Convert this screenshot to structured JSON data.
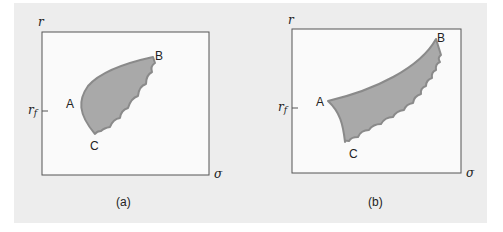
{
  "figure": {
    "colors": {
      "background": "#ededed",
      "plot_area": "#fafafa",
      "region_fill": "#a9a9a9",
      "region_edge": "#8a8a8a",
      "axis": "#555555"
    },
    "panels": [
      {
        "caption": "(a)",
        "y_axis_label": "r",
        "x_axis_label": "σ",
        "tick_label": "r",
        "tick_sub": "f",
        "points": {
          "A": "A",
          "B": "B",
          "C": "C"
        }
      },
      {
        "caption": "(b)",
        "y_axis_label": "r",
        "x_axis_label": "σ",
        "tick_label": "r",
        "tick_sub": "f",
        "points": {
          "A": "A",
          "B": "B",
          "C": "C"
        }
      }
    ]
  }
}
